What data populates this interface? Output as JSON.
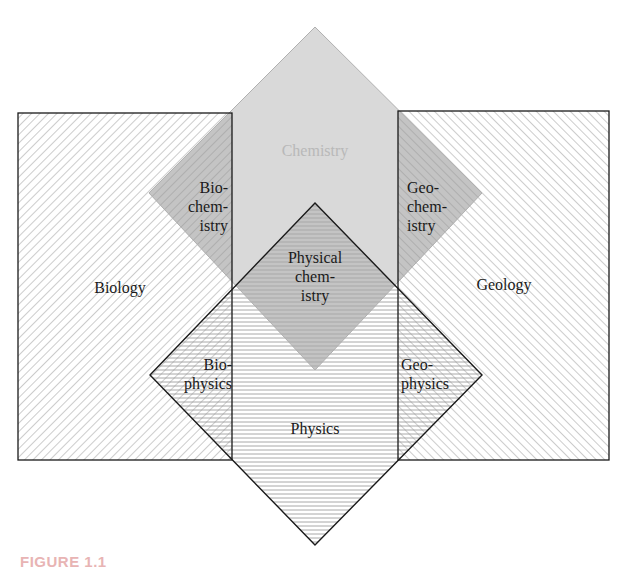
{
  "diagram": {
    "type": "overlapping-fields",
    "fields": {
      "chemistry": "Chemistry",
      "biology": "Biology",
      "geology": "Geology",
      "physics": "Physics"
    },
    "intersections": {
      "biochemistry": "Bio-\nchem-\nistry",
      "geochemistry": "Geo-\nchem-\nistry",
      "physical_chemistry": "Physical\nchem-\nistry",
      "biophysics": "Bio-\nphysics",
      "geophysics": "Geo-\nphysics"
    },
    "colors": {
      "chemistry_fill": "#d9d9d9",
      "overlap_fill": "#c4c4c4",
      "hatch_line": "#9a9a9a",
      "outline": "#1a1a1a",
      "chemistry_label": "#b8b8b8",
      "caption": "#e8b4b4"
    }
  },
  "caption": "FIGURE 1.1"
}
